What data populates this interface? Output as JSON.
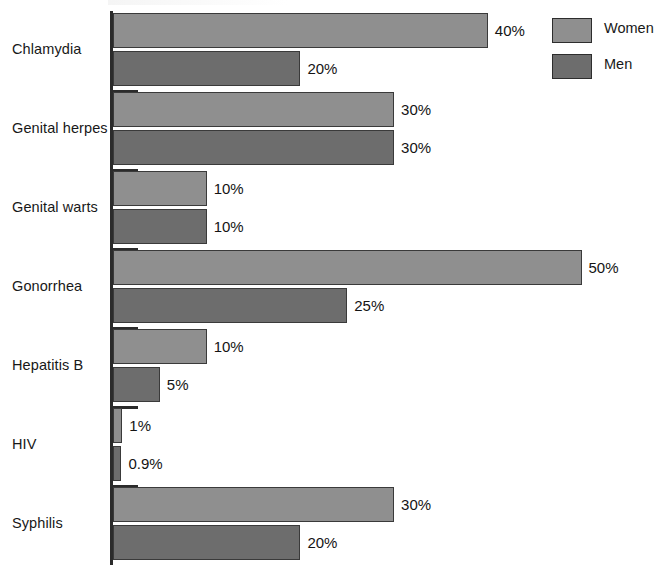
{
  "chart_data": {
    "type": "bar",
    "orientation": "horizontal",
    "title": "",
    "xlabel": "",
    "ylabel": "",
    "xlim": [
      0,
      50
    ],
    "grid": false,
    "value_suffix": "%",
    "legend_position": "top-right",
    "categories": [
      "Chlamydia",
      "Genital herpes",
      "Genital warts",
      "Gonorrhea",
      "Hepatitis B",
      "HIV",
      "Syphilis"
    ],
    "series": [
      {
        "name": "Women",
        "color": "#8f8f8f",
        "values": [
          40,
          30,
          10,
          50,
          10,
          1,
          30
        ],
        "labels": [
          "40%",
          "30%",
          "10%",
          "50%",
          "10%",
          "1%",
          "30%"
        ]
      },
      {
        "name": "Men",
        "color": "#6d6d6d",
        "values": [
          20,
          30,
          10,
          25,
          5,
          0.9,
          20
        ],
        "labels": [
          "20%",
          "30%",
          "10%",
          "25%",
          "5%",
          "0.9%",
          "20%"
        ]
      }
    ]
  },
  "legend": {
    "items": [
      {
        "label": "Women",
        "color": "#8f8f8f"
      },
      {
        "label": "Men",
        "color": "#6d6d6d"
      }
    ]
  },
  "axis": {
    "line_color": "#2b2b2b",
    "tick_color": "#2b2b2b"
  }
}
